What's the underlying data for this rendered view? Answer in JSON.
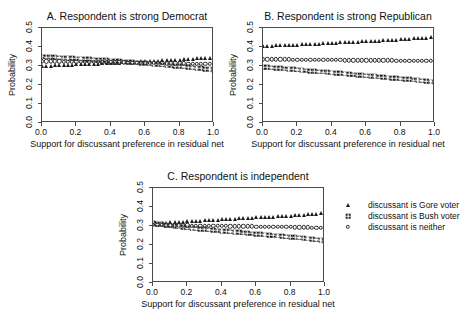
{
  "chart_data": [
    {
      "type": "scatter",
      "panel_id": "A",
      "title": "A. Respondent is strong Democrat",
      "xlabel": "Support for discussant preference in residual net",
      "ylabel": "Probability",
      "xlim": [
        0.0,
        1.0
      ],
      "ylim": [
        0.0,
        0.5
      ],
      "xticks": [
        "0.0",
        "0.2",
        "0.4",
        "0.6",
        "0.8",
        "1.0"
      ],
      "xtick_values": [
        0.0,
        0.2,
        0.4,
        0.6,
        0.8,
        1.0
      ],
      "yticks": [
        "0.0",
        "0.1",
        "0.2",
        "0.3",
        "0.4",
        "0.5"
      ],
      "ytick_values": [
        0.0,
        0.1,
        0.2,
        0.3,
        0.4,
        0.5
      ],
      "grid": false,
      "x": [
        0.0,
        0.025,
        0.05,
        0.075,
        0.1,
        0.125,
        0.15,
        0.175,
        0.2,
        0.225,
        0.25,
        0.275,
        0.3,
        0.325,
        0.35,
        0.375,
        0.4,
        0.425,
        0.45,
        0.475,
        0.5,
        0.525,
        0.55,
        0.575,
        0.6,
        0.625,
        0.65,
        0.675,
        0.7,
        0.725,
        0.75,
        0.775,
        0.8,
        0.825,
        0.85,
        0.875,
        0.9,
        0.925,
        0.95,
        0.975,
        1.0
      ],
      "series": [
        {
          "name": "discussant is Gore voter",
          "marker": "triangle",
          "values": [
            0.3,
            0.301,
            0.302,
            0.303,
            0.304,
            0.305,
            0.306,
            0.307,
            0.308,
            0.309,
            0.31,
            0.311,
            0.312,
            0.313,
            0.314,
            0.315,
            0.316,
            0.317,
            0.318,
            0.319,
            0.32,
            0.321,
            0.322,
            0.324,
            0.325,
            0.326,
            0.327,
            0.328,
            0.329,
            0.331,
            0.332,
            0.333,
            0.334,
            0.336,
            0.337,
            0.338,
            0.34,
            0.341,
            0.342,
            0.344,
            0.345
          ]
        },
        {
          "name": "discussant is Bush voter",
          "marker": "asterisk",
          "values": [
            0.35,
            0.348,
            0.347,
            0.346,
            0.344,
            0.343,
            0.342,
            0.34,
            0.339,
            0.338,
            0.336,
            0.335,
            0.333,
            0.332,
            0.33,
            0.329,
            0.327,
            0.326,
            0.324,
            0.322,
            0.321,
            0.319,
            0.317,
            0.316,
            0.314,
            0.312,
            0.31,
            0.308,
            0.306,
            0.304,
            0.302,
            0.3,
            0.298,
            0.296,
            0.294,
            0.291,
            0.289,
            0.287,
            0.284,
            0.282,
            0.279
          ]
        },
        {
          "name": "discussant is neither",
          "marker": "circle",
          "values": [
            0.325,
            0.325,
            0.324,
            0.324,
            0.324,
            0.323,
            0.323,
            0.323,
            0.322,
            0.322,
            0.322,
            0.321,
            0.321,
            0.321,
            0.32,
            0.32,
            0.32,
            0.319,
            0.319,
            0.319,
            0.318,
            0.318,
            0.318,
            0.317,
            0.317,
            0.317,
            0.316,
            0.316,
            0.316,
            0.315,
            0.315,
            0.315,
            0.314,
            0.314,
            0.313,
            0.313,
            0.313,
            0.312,
            0.312,
            0.311,
            0.311
          ]
        }
      ]
    },
    {
      "type": "scatter",
      "panel_id": "B",
      "title": "B. Respondent is strong Republican",
      "xlabel": "Support for discussant preference in residual net",
      "ylabel": "Probability",
      "xlim": [
        0.0,
        1.0
      ],
      "ylim": [
        0.0,
        0.5
      ],
      "xticks": [
        "0.0",
        "0.2",
        "0.4",
        "0.6",
        "0.8",
        "1.0"
      ],
      "xtick_values": [
        0.0,
        0.2,
        0.4,
        0.6,
        0.8,
        1.0
      ],
      "yticks": [
        "0.0",
        "0.1",
        "0.2",
        "0.3",
        "0.4",
        "0.5"
      ],
      "ytick_values": [
        0.0,
        0.1,
        0.2,
        0.3,
        0.4,
        0.5
      ],
      "grid": false,
      "x": [
        0.0,
        0.025,
        0.05,
        0.075,
        0.1,
        0.125,
        0.15,
        0.175,
        0.2,
        0.225,
        0.25,
        0.275,
        0.3,
        0.325,
        0.35,
        0.375,
        0.4,
        0.425,
        0.45,
        0.475,
        0.5,
        0.525,
        0.55,
        0.575,
        0.6,
        0.625,
        0.65,
        0.675,
        0.7,
        0.725,
        0.75,
        0.775,
        0.8,
        0.825,
        0.85,
        0.875,
        0.9,
        0.925,
        0.95,
        0.975,
        1.0
      ],
      "series": [
        {
          "name": "discussant is Gore voter",
          "marker": "triangle",
          "values": [
            0.405,
            0.406,
            0.407,
            0.408,
            0.409,
            0.41,
            0.411,
            0.412,
            0.413,
            0.414,
            0.415,
            0.416,
            0.417,
            0.418,
            0.419,
            0.42,
            0.421,
            0.423,
            0.424,
            0.425,
            0.426,
            0.427,
            0.428,
            0.429,
            0.431,
            0.432,
            0.433,
            0.434,
            0.436,
            0.437,
            0.438,
            0.439,
            0.441,
            0.442,
            0.443,
            0.445,
            0.446,
            0.448,
            0.45,
            0.452,
            0.455
          ]
        },
        {
          "name": "discussant is Bush voter",
          "marker": "asterisk",
          "values": [
            0.295,
            0.293,
            0.291,
            0.289,
            0.287,
            0.285,
            0.284,
            0.282,
            0.28,
            0.278,
            0.276,
            0.274,
            0.272,
            0.27,
            0.269,
            0.267,
            0.265,
            0.263,
            0.261,
            0.259,
            0.257,
            0.255,
            0.253,
            0.251,
            0.249,
            0.247,
            0.245,
            0.243,
            0.241,
            0.239,
            0.237,
            0.235,
            0.233,
            0.231,
            0.229,
            0.227,
            0.225,
            0.223,
            0.221,
            0.218,
            0.215
          ]
        },
        {
          "name": "discussant is neither",
          "marker": "circle",
          "values": [
            0.336,
            0.336,
            0.336,
            0.335,
            0.335,
            0.335,
            0.335,
            0.334,
            0.334,
            0.334,
            0.334,
            0.333,
            0.333,
            0.333,
            0.333,
            0.332,
            0.332,
            0.332,
            0.332,
            0.331,
            0.331,
            0.331,
            0.331,
            0.33,
            0.33,
            0.33,
            0.33,
            0.329,
            0.329,
            0.329,
            0.329,
            0.328,
            0.328,
            0.328,
            0.327,
            0.327,
            0.327,
            0.326,
            0.326,
            0.326,
            0.325
          ]
        }
      ]
    },
    {
      "type": "scatter",
      "panel_id": "C",
      "title": "C. Respondent is independent",
      "xlabel": "Support for discussant preference in residual net",
      "ylabel": "Probability",
      "xlim": [
        0.0,
        1.0
      ],
      "ylim": [
        0.0,
        0.5
      ],
      "xticks": [
        "0.0",
        "0.2",
        "0.4",
        "0.6",
        "0.8",
        "1.0"
      ],
      "xtick_values": [
        0.0,
        0.2,
        0.4,
        0.6,
        0.8,
        1.0
      ],
      "yticks": [
        "0.0",
        "0.1",
        "0.2",
        "0.3",
        "0.4",
        "0.5"
      ],
      "ytick_values": [
        0.0,
        0.1,
        0.2,
        0.3,
        0.4,
        0.5
      ],
      "grid": false,
      "x": [
        0.0,
        0.025,
        0.05,
        0.075,
        0.1,
        0.125,
        0.15,
        0.175,
        0.2,
        0.225,
        0.25,
        0.275,
        0.3,
        0.325,
        0.35,
        0.375,
        0.4,
        0.425,
        0.45,
        0.475,
        0.5,
        0.525,
        0.55,
        0.575,
        0.6,
        0.625,
        0.65,
        0.675,
        0.7,
        0.725,
        0.75,
        0.775,
        0.8,
        0.825,
        0.85,
        0.875,
        0.9,
        0.925,
        0.95,
        0.975,
        1.0
      ],
      "series": [
        {
          "name": "discussant is Gore voter",
          "marker": "triangle",
          "values": [
            0.315,
            0.316,
            0.317,
            0.318,
            0.32,
            0.321,
            0.322,
            0.323,
            0.325,
            0.326,
            0.327,
            0.328,
            0.33,
            0.331,
            0.332,
            0.333,
            0.335,
            0.336,
            0.337,
            0.338,
            0.34,
            0.341,
            0.342,
            0.343,
            0.345,
            0.346,
            0.347,
            0.348,
            0.35,
            0.351,
            0.352,
            0.353,
            0.355,
            0.356,
            0.358,
            0.359,
            0.361,
            0.362,
            0.364,
            0.366,
            0.369
          ]
        },
        {
          "name": "discussant is Bush voter",
          "marker": "asterisk",
          "values": [
            0.315,
            0.311,
            0.308,
            0.305,
            0.302,
            0.299,
            0.296,
            0.293,
            0.29,
            0.288,
            0.286,
            0.284,
            0.282,
            0.28,
            0.278,
            0.276,
            0.274,
            0.272,
            0.27,
            0.268,
            0.266,
            0.264,
            0.262,
            0.26,
            0.258,
            0.256,
            0.254,
            0.252,
            0.25,
            0.248,
            0.246,
            0.244,
            0.242,
            0.24,
            0.238,
            0.236,
            0.233,
            0.231,
            0.228,
            0.225,
            0.221
          ]
        },
        {
          "name": "discussant is neither",
          "marker": "circle",
          "values": [
            0.305,
            0.305,
            0.305,
            0.304,
            0.304,
            0.304,
            0.303,
            0.303,
            0.303,
            0.302,
            0.302,
            0.302,
            0.301,
            0.301,
            0.301,
            0.3,
            0.3,
            0.3,
            0.299,
            0.299,
            0.299,
            0.298,
            0.298,
            0.298,
            0.297,
            0.297,
            0.297,
            0.296,
            0.296,
            0.296,
            0.295,
            0.295,
            0.295,
            0.294,
            0.294,
            0.293,
            0.293,
            0.292,
            0.292,
            0.291,
            0.29
          ]
        }
      ]
    }
  ],
  "legend": {
    "entries": [
      {
        "marker": "triangle",
        "label": "discussant is Gore voter"
      },
      {
        "marker": "asterisk",
        "label": "discussant is Bush voter"
      },
      {
        "marker": "circle",
        "label": "discussant is neither"
      }
    ]
  }
}
